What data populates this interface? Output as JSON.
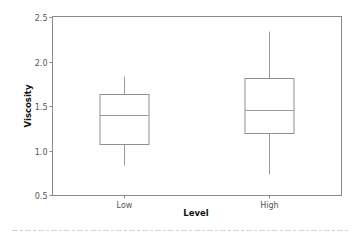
{
  "chart_data": {
    "type": "box",
    "title": "",
    "xlabel": "Level",
    "ylabel": "Viscosity",
    "ylim": [
      0.5,
      2.5
    ],
    "yticks": [
      "0.5",
      "1.0",
      "1.5",
      "2.0",
      "2.5"
    ],
    "categories": [
      "Low",
      "High"
    ],
    "series": [
      {
        "name": "Low",
        "whisker_low": 0.84,
        "q1": 1.07,
        "median": 1.4,
        "q3": 1.63,
        "whisker_high": 1.84
      },
      {
        "name": "High",
        "whisker_low": 0.74,
        "q1": 1.2,
        "median": 1.46,
        "q3": 1.81,
        "whisker_high": 2.34
      }
    ],
    "grid": false,
    "legend": null
  }
}
